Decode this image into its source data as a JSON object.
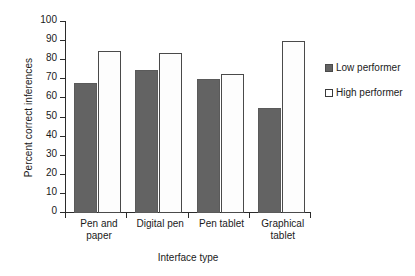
{
  "chart_data": {
    "type": "bar",
    "title": "",
    "xlabel": "Interface type",
    "ylabel": "Percent correct inferences",
    "categories": [
      "Pen and paper",
      "Digital pen",
      "Pen tablet",
      "Graphical tablet"
    ],
    "category_lines": [
      [
        "Pen and",
        "paper"
      ],
      [
        "Digital pen",
        ""
      ],
      [
        "Pen tablet",
        ""
      ],
      [
        "Graphical",
        "tablet"
      ]
    ],
    "series": [
      {
        "name": "Low performer",
        "values": [
          68,
          75,
          70,
          55
        ],
        "color": "#636363",
        "fill": "solid"
      },
      {
        "name": "High performer",
        "values": [
          85,
          84,
          73,
          90
        ],
        "color": "#ffffff",
        "fill": "open"
      }
    ],
    "ylim": [
      0,
      100
    ],
    "yticks": [
      0,
      10,
      20,
      30,
      40,
      50,
      60,
      70,
      80,
      90,
      100
    ],
    "ytick_labels": [
      "0",
      "10",
      "20",
      "30",
      "40",
      "50",
      "60",
      "70",
      "80",
      "90",
      "100"
    ],
    "grid": false,
    "legend_position": "right"
  },
  "legend": {
    "entries": [
      {
        "label": "Low performer"
      },
      {
        "label": "High performer"
      }
    ]
  },
  "colors": {
    "low_performer": "#636363",
    "high_performer": "#ffffff",
    "axis": "#2b2b2b",
    "background": "#ffffff"
  }
}
